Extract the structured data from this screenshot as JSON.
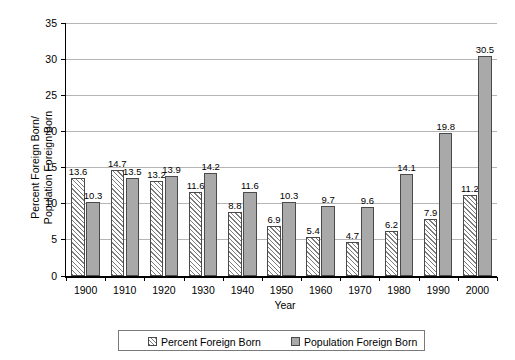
{
  "chart_data": {
    "type": "bar",
    "title": "",
    "xlabel": "Year",
    "ylabel": "Percent Foreign Born/\nPopulation Foreign Born",
    "categories": [
      "1900",
      "1910",
      "1920",
      "1930",
      "1940",
      "1950",
      "1960",
      "1970",
      "1980",
      "1990",
      "2000"
    ],
    "ylim": [
      0,
      35
    ],
    "yticks": [
      "0",
      "5",
      "10",
      "15",
      "20",
      "25",
      "30",
      "35"
    ],
    "ytick_values": [
      0,
      5,
      10,
      15,
      20,
      25,
      30,
      35
    ],
    "grid": "horizontal",
    "legend_position": "bottom",
    "series": [
      {
        "name": "Percent Foreign Born",
        "pattern": "diagonal-hatch",
        "color": "#ffffff",
        "values": [
          13.6,
          14.7,
          13.2,
          11.6,
          8.8,
          6.9,
          5.4,
          4.7,
          6.2,
          7.9,
          11.2
        ],
        "labels": [
          "13.6",
          "14.7",
          "13.2",
          "11.6",
          "8.8",
          "6.9",
          "5.4",
          "4.7",
          "6.2",
          "7.9",
          "11.2"
        ]
      },
      {
        "name": "Population Foreign Born",
        "pattern": "solid",
        "color": "#a9a9a9",
        "values": [
          10.3,
          13.5,
          13.9,
          14.2,
          11.6,
          10.3,
          9.7,
          9.6,
          14.1,
          19.8,
          30.5
        ],
        "labels": [
          "10.3",
          "13.5",
          "13.9",
          "14.2",
          "11.6",
          "10.3",
          "9.7",
          "9.6",
          "14.1",
          "19.8",
          "30.5"
        ]
      }
    ]
  },
  "legend": {
    "items": [
      {
        "label": "Percent Foreign Born"
      },
      {
        "label": "Population Foreign Born"
      }
    ]
  },
  "axes": {
    "x_title": "Year",
    "y_title": "Percent Foreign Born/\nPopulation Foreign Born"
  }
}
